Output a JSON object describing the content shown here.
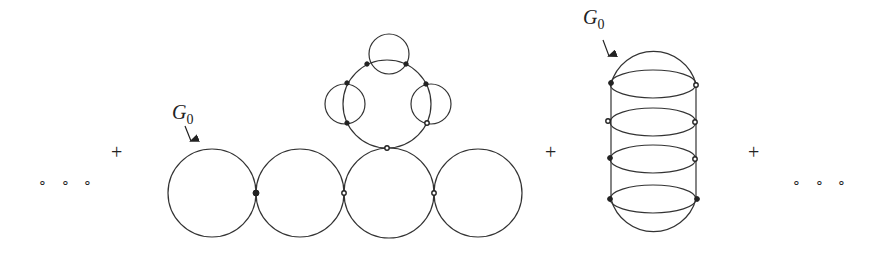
{
  "diagram": {
    "ellipsis_left": "∘ ∘ ∘",
    "ellipsis_right": "∘ ∘ ∘",
    "plus_1": "+",
    "plus_2": "+",
    "plus_3": "+",
    "figure_1": {
      "label_main": "G",
      "label_sub": "0",
      "description": "Chain of four tangent circles; third circle has an attached ring with three loop bubbles"
    },
    "figure_2": {
      "label_main": "G",
      "label_sub": "0",
      "description": "Capsule shape with four horizontal ellipses (ladder of loops)"
    },
    "colors": {
      "line": "#333333",
      "background": "#ffffff"
    }
  }
}
